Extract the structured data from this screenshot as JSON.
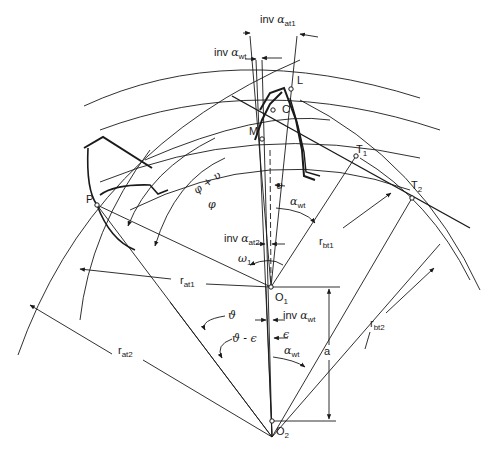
{
  "diagram": {
    "stroke_color": "#1a1a1a",
    "background": "#ffffff",
    "points": {
      "P": "P",
      "M": "M",
      "C": "C",
      "L": "L",
      "T1": "T",
      "T1_sub": "1",
      "T2": "T",
      "T2_sub": "2",
      "O1": "O",
      "O1_sub": "1",
      "O2": "O",
      "O2_sub": "2"
    },
    "labels": {
      "inv_at1_prefix": "inv ",
      "inv_at1_greek": "α",
      "inv_at1_sub": "at1",
      "inv_wt_top_prefix": "inv ",
      "inv_wt_top_greek": "α",
      "inv_wt_top_sub": "wt",
      "phi_plus_nu": "φ + υ",
      "phi": "φ",
      "nu": "υ",
      "alpha_wt_upper_greek": "α",
      "alpha_wt_upper_sub": "wt",
      "inv_at2_prefix": "inv ",
      "inv_at2_greek": "α",
      "inv_at2_sub": "at2",
      "omega1_greek": "ω",
      "omega1_sub": "1",
      "r_bt1": "r",
      "r_bt1_sub": "bt1",
      "r_at1": "r",
      "r_at1_sub": "at1",
      "r_bt2": "r",
      "r_bt2_sub": "bt2",
      "r_at2": "r",
      "r_at2_sub": "at2",
      "theta": "ϑ",
      "theta_minus_eps": "ϑ - ϵ",
      "inv_wt_lower_prefix": "inv ",
      "inv_wt_lower_greek": "α",
      "inv_wt_lower_sub": "wt",
      "epsilon": "ϵ",
      "alpha_wt_lower_greek": "α",
      "alpha_wt_lower_sub": "wt",
      "center_distance": "a"
    }
  }
}
